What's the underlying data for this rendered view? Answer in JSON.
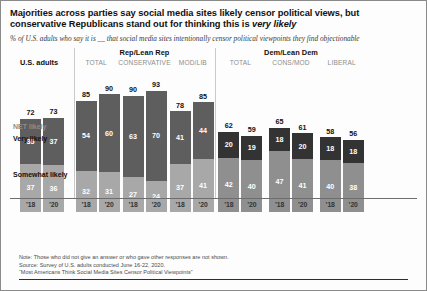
{
  "title_line1": "Majorities across parties say social media sites likely censor political views, but",
  "title_line2_a": "conservative Republicans stand out for thinking this is ",
  "title_line2_b": "very likely",
  "subtitle": "% of U.S. adults who say it is __ that social media sites intentionally censor political viewpoints they find objectionable",
  "legend": {
    "net": "NET likely",
    "very": "Very likely",
    "somewhat": "Somewhat likely"
  },
  "colors": {
    "rep_very": "#5e5e5e",
    "rep_somewhat": "#a8a8a8",
    "dem_very": "#333333",
    "dem_somewhat": "#8f8f8f",
    "us_very": "#5e5e5e",
    "us_somewhat": "#a8a8a8",
    "axis": "#6e6e6e",
    "divider": "#c9c9c9"
  },
  "footer": {
    "note": "Note: Those who did not give an answer or who gave other responses are not shown.",
    "source": "Source: Survey of U.S. adults conducted June 16-22, 2020.",
    "report": "“Most Americans Think Social Media Sites Censor Political Viewpoints”"
  },
  "chart_data": {
    "type": "bar",
    "title": "Majorities across parties say social media sites likely censor political views, but conservative Republicans stand out for thinking this is very likely",
    "subtitle": "% of U.S. adults who say it is __ that social media sites intentionally censor political viewpoints they find objectionable",
    "xlabel": "",
    "ylabel": "",
    "ylim": [
      0,
      100
    ],
    "grid": false,
    "stacked": true,
    "legend_position": "right",
    "series": [
      {
        "name": "Very likely"
      },
      {
        "name": "Somewhat likely"
      },
      {
        "name": "NET likely"
      }
    ],
    "panels": [
      {
        "id": "us-adults",
        "panel_title": "",
        "panel_label": "U.S. adults",
        "columns": [
          {
            "header": "",
            "bars": [
              {
                "year": "’18",
                "net": 72,
                "very": 35,
                "somewhat": 37
              },
              {
                "year": "’20",
                "net": 73,
                "very": 37,
                "somewhat": 36
              }
            ]
          }
        ]
      },
      {
        "id": "rep-lean-rep",
        "panel_title": "Rep/Lean Rep",
        "panel_label": "",
        "columns": [
          {
            "header": "TOTAL",
            "bars": [
              {
                "year": "’18",
                "net": 85,
                "very": 54,
                "somewhat": 32
              },
              {
                "year": "’20",
                "net": 90,
                "very": 60,
                "somewhat": 31
              }
            ]
          },
          {
            "header": "CONSERVATIVE",
            "bars": [
              {
                "year": "’18",
                "net": 90,
                "very": 63,
                "somewhat": 27
              },
              {
                "year": "’20",
                "net": 93,
                "very": 70,
                "somewhat": 24
              }
            ]
          },
          {
            "header": "MOD/LIB",
            "bars": [
              {
                "year": "’18",
                "net": 78,
                "very": 41,
                "somewhat": 37
              },
              {
                "year": "’20",
                "net": 85,
                "very": 44,
                "somewhat": 41
              }
            ]
          }
        ]
      },
      {
        "id": "dem-lean-dem",
        "panel_title": "Dem/Lean Dem",
        "panel_label": "",
        "columns": [
          {
            "header": "TOTAL",
            "bars": [
              {
                "year": "’18",
                "net": 62,
                "very": 20,
                "somewhat": 42
              },
              {
                "year": "’20",
                "net": 59,
                "very": 19,
                "somewhat": 40
              }
            ]
          },
          {
            "header": "CONS/MOD",
            "bars": [
              {
                "year": "’18",
                "net": 65,
                "very": 18,
                "somewhat": 47
              },
              {
                "year": "’20",
                "net": 61,
                "very": 20,
                "somewhat": 41
              }
            ]
          },
          {
            "header": "LIBERAL",
            "bars": [
              {
                "year": "’18",
                "net": 58,
                "very": 18,
                "somewhat": 40
              },
              {
                "year": "’20",
                "net": 56,
                "very": 18,
                "somewhat": 38
              }
            ]
          }
        ]
      }
    ]
  }
}
